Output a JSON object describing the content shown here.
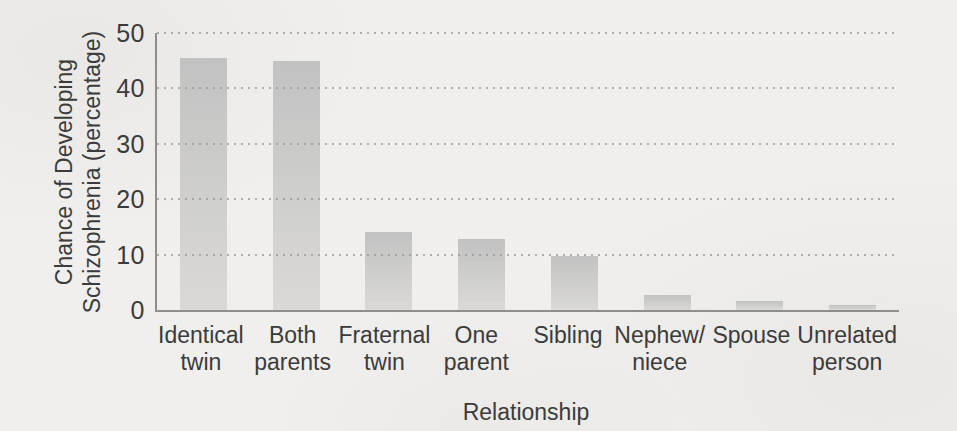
{
  "chart_data": {
    "type": "bar",
    "title": "",
    "xlabel": "Relationship",
    "ylabel": "Chance of Developing Schizophrenia (percentage)",
    "ylabel_lines": [
      "Chance of Developing",
      "Schizophrenia (percentage)"
    ],
    "categories": [
      "Identical\ntwin",
      "Both\nparents",
      "Fraternal\ntwin",
      "One\nparent",
      "Sibling",
      "Nephew/\nniece",
      "Spouse",
      "Unrelated\nperson"
    ],
    "values": [
      45.5,
      45,
      14,
      12.8,
      9.7,
      2.8,
      1.7,
      0.9
    ],
    "ylim": [
      0,
      50
    ],
    "yticks": [
      0,
      10,
      20,
      30,
      40,
      50
    ],
    "grid": "horizontal dotted lines at each y tick, no vertical grid",
    "legend": "none",
    "colors": {
      "paper": "#f0efed",
      "text": "#3b3b3b",
      "axis": "#8e8e8e",
      "grid": "#979797",
      "bar_top": "#c2c2c2",
      "bar_bottom": "#dad9d6"
    }
  }
}
